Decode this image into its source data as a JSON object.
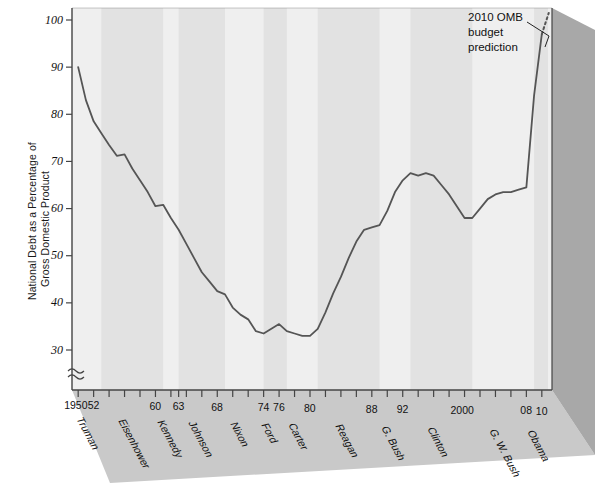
{
  "figure": {
    "ylabel_line1": "National Debt as a Percentage of",
    "ylabel_line2": "Gross Domestic Product",
    "annotation_line1": "2010 OMB",
    "annotation_line2": "budget",
    "annotation_line3": "prediction",
    "axis_break_symbol": "≈",
    "line_color": "#555555",
    "plot_bg": "#efefef",
    "band_color": "#e2e2e2",
    "floor_color": "#c9c9c9",
    "side_color": "#a8a8a8",
    "axis_color": "#444444"
  },
  "chart_data": {
    "type": "line",
    "title": "",
    "xlabel": "",
    "ylabel": "National Debt as a Percentage of Gross Domestic Product",
    "ylim": [
      28,
      100
    ],
    "xlim": [
      1949.2,
      2010.8
    ],
    "yticks": [
      30,
      40,
      50,
      60,
      70,
      80,
      90,
      100
    ],
    "ytick_labels": [
      "30",
      "40",
      "50",
      "60",
      "70",
      "80",
      "90",
      "100"
    ],
    "grid": false,
    "legend": "none",
    "axis_break_below": 30,
    "xtick_years": [
      1950,
      1952,
      1954,
      1956,
      1958,
      1960,
      1962,
      1963,
      1964,
      1966,
      1968,
      1970,
      1972,
      1974,
      1976,
      1978,
      1980,
      1982,
      1984,
      1986,
      1988,
      1990,
      1992,
      1994,
      1996,
      1998,
      2000,
      2002,
      2004,
      2006,
      2008,
      2010
    ],
    "xtick_labeled": [
      {
        "year": 1950,
        "label": "1950"
      },
      {
        "year": 1952,
        "label": "52"
      },
      {
        "year": 1960,
        "label": "60"
      },
      {
        "year": 1963,
        "label": "63"
      },
      {
        "year": 1968,
        "label": "68"
      },
      {
        "year": 1974,
        "label": "74"
      },
      {
        "year": 1976,
        "label": "76"
      },
      {
        "year": 1980,
        "label": "80"
      },
      {
        "year": 1988,
        "label": "88"
      },
      {
        "year": 1992,
        "label": "92"
      },
      {
        "year": 2000,
        "label": "2000"
      },
      {
        "year": 2008,
        "label": "08"
      },
      {
        "year": 2010,
        "label": "10"
      }
    ],
    "presidents": [
      {
        "name": "Truman",
        "start": 1950,
        "end": 1953
      },
      {
        "name": "Eisenhower",
        "start": 1953,
        "end": 1961
      },
      {
        "name": "Kennedy",
        "start": 1961,
        "end": 1963
      },
      {
        "name": "Johnson",
        "start": 1963,
        "end": 1969
      },
      {
        "name": "Nixon",
        "start": 1969,
        "end": 1974
      },
      {
        "name": "Ford",
        "start": 1974,
        "end": 1977
      },
      {
        "name": "Carter",
        "start": 1977,
        "end": 1981
      },
      {
        "name": "Reagan",
        "start": 1981,
        "end": 1989
      },
      {
        "name": "G. Bush",
        "start": 1989,
        "end": 1993
      },
      {
        "name": "Clinton",
        "start": 1993,
        "end": 2001
      },
      {
        "name": "G. W. Bush",
        "start": 2001,
        "end": 2009
      },
      {
        "name": "Obama",
        "start": 2009,
        "end": 2010.8
      }
    ],
    "x": [
      1950,
      1951,
      1952,
      1953,
      1954,
      1955,
      1956,
      1957,
      1958,
      1959,
      1960,
      1961,
      1962,
      1963,
      1964,
      1965,
      1966,
      1967,
      1968,
      1969,
      1970,
      1971,
      1972,
      1973,
      1974,
      1975,
      1976,
      1977,
      1978,
      1979,
      1980,
      1981,
      1982,
      1983,
      1984,
      1985,
      1986,
      1987,
      1988,
      1989,
      1990,
      1991,
      1992,
      1993,
      1994,
      1995,
      1996,
      1997,
      1998,
      1999,
      2000,
      2001,
      2002,
      2003,
      2004,
      2005,
      2006,
      2007,
      2008,
      2009,
      2010
    ],
    "values": [
      90.0,
      83.0,
      78.5,
      76.0,
      73.5,
      71.2,
      71.5,
      68.5,
      66.0,
      63.5,
      60.5,
      60.8,
      58.0,
      55.5,
      52.5,
      49.5,
      46.5,
      44.5,
      42.5,
      41.8,
      39.0,
      37.5,
      36.5,
      34.0,
      33.5,
      34.5,
      35.5,
      34.0,
      33.5,
      33.0,
      33.0,
      34.5,
      38.0,
      42.0,
      45.5,
      49.5,
      53.0,
      55.5,
      56.0,
      56.5,
      59.5,
      63.5,
      66.0,
      67.5,
      67.0,
      67.5,
      67.0,
      65.0,
      63.0,
      60.5,
      58.0,
      58.0,
      60.0,
      62.0,
      63.0,
      63.5,
      63.5,
      64.0,
      64.5,
      84.0,
      97.0
    ],
    "prediction_segment": {
      "style": "dotted",
      "x": [
        2010,
        2010.9
      ],
      "values": [
        97.0,
        101.5
      ],
      "label": "2010 OMB budget prediction"
    },
    "annotations": [
      {
        "text": "2010 OMB budget prediction",
        "x": 2010.5,
        "y": 99
      }
    ]
  }
}
